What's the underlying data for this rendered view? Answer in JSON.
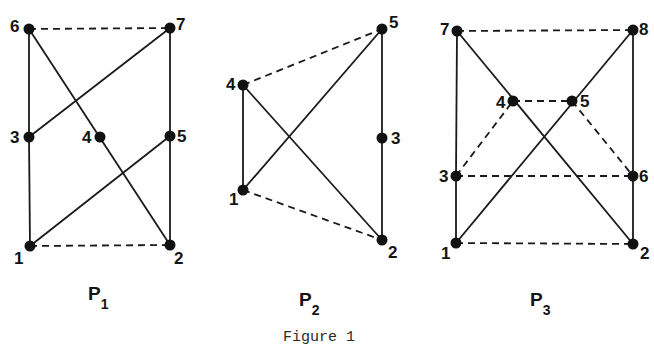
{
  "caption": "Figure 1",
  "colors": {
    "ink": "#111111",
    "background": "#ffffff"
  },
  "panels": [
    {
      "id": "P1",
      "name": "P",
      "subscript": "1",
      "label_pos": [
        88,
        300
      ],
      "nodes": [
        {
          "id": "1",
          "x": 30,
          "y": 246,
          "lx": 14,
          "ly": 264
        },
        {
          "id": "2",
          "x": 170,
          "y": 245,
          "lx": 174,
          "ly": 264
        },
        {
          "id": "3",
          "x": 29,
          "y": 137,
          "lx": 10,
          "ly": 143
        },
        {
          "id": "4",
          "x": 100,
          "y": 137,
          "lx": 82,
          "ly": 143
        },
        {
          "id": "5",
          "x": 170,
          "y": 136,
          "lx": 177,
          "ly": 142
        },
        {
          "id": "6",
          "x": 29,
          "y": 29,
          "lx": 10,
          "ly": 32
        },
        {
          "id": "7",
          "x": 170,
          "y": 28,
          "lx": 176,
          "ly": 30
        }
      ],
      "edges": [
        {
          "from": "6",
          "to": "7",
          "style": "dashed"
        },
        {
          "from": "1",
          "to": "2",
          "style": "dashed"
        },
        {
          "from": "6",
          "to": "3",
          "style": "solid"
        },
        {
          "from": "3",
          "to": "1",
          "style": "solid"
        },
        {
          "from": "7",
          "to": "5",
          "style": "solid"
        },
        {
          "from": "5",
          "to": "2",
          "style": "solid"
        },
        {
          "from": "3",
          "to": "7",
          "style": "solid"
        },
        {
          "from": "6",
          "to": "2",
          "style": "solid"
        },
        {
          "from": "1",
          "to": "5",
          "style": "solid"
        }
      ]
    },
    {
      "id": "P2",
      "name": "P",
      "subscript": "2",
      "label_pos": [
        299,
        306
      ],
      "nodes": [
        {
          "id": "1",
          "x": 243,
          "y": 190,
          "lx": 229,
          "ly": 205
        },
        {
          "id": "2",
          "x": 382,
          "y": 240,
          "lx": 388,
          "ly": 258
        },
        {
          "id": "3",
          "x": 382,
          "y": 138,
          "lx": 391,
          "ly": 144
        },
        {
          "id": "4",
          "x": 243,
          "y": 85,
          "lx": 226,
          "ly": 90
        },
        {
          "id": "5",
          "x": 382,
          "y": 29,
          "lx": 389,
          "ly": 28
        }
      ],
      "edges": [
        {
          "from": "4",
          "to": "5",
          "style": "dashed"
        },
        {
          "from": "1",
          "to": "2",
          "style": "dashed"
        },
        {
          "from": "4",
          "to": "1",
          "style": "solid"
        },
        {
          "from": "5",
          "to": "3",
          "style": "solid"
        },
        {
          "from": "3",
          "to": "2",
          "style": "solid"
        },
        {
          "from": "1",
          "to": "5",
          "style": "solid"
        },
        {
          "from": "4",
          "to": "2",
          "style": "solid"
        }
      ]
    },
    {
      "id": "P3",
      "name": "P",
      "subscript": "3",
      "label_pos": [
        530,
        306
      ],
      "nodes": [
        {
          "id": "1",
          "x": 456,
          "y": 243,
          "lx": 441,
          "ly": 259
        },
        {
          "id": "2",
          "x": 633,
          "y": 244,
          "lx": 640,
          "ly": 259
        },
        {
          "id": "3",
          "x": 456,
          "y": 176,
          "lx": 439,
          "ly": 182
        },
        {
          "id": "4",
          "x": 513,
          "y": 101,
          "lx": 496,
          "ly": 108
        },
        {
          "id": "5",
          "x": 572,
          "y": 101,
          "lx": 580,
          "ly": 107
        },
        {
          "id": "6",
          "x": 633,
          "y": 176,
          "lx": 639,
          "ly": 182
        },
        {
          "id": "7",
          "x": 457,
          "y": 31,
          "lx": 440,
          "ly": 35
        },
        {
          "id": "8",
          "x": 633,
          "y": 30,
          "lx": 639,
          "ly": 35
        }
      ],
      "edges": [
        {
          "from": "7",
          "to": "8",
          "style": "dashed"
        },
        {
          "from": "4",
          "to": "5",
          "style": "dashed"
        },
        {
          "from": "3",
          "to": "4",
          "style": "dashed"
        },
        {
          "from": "5",
          "to": "6",
          "style": "dashed"
        },
        {
          "from": "3",
          "to": "6",
          "style": "dashed"
        },
        {
          "from": "1",
          "to": "2",
          "style": "dashed"
        },
        {
          "from": "7",
          "to": "3",
          "style": "solid"
        },
        {
          "from": "3",
          "to": "1",
          "style": "solid"
        },
        {
          "from": "8",
          "to": "6",
          "style": "solid"
        },
        {
          "from": "6",
          "to": "2",
          "style": "solid"
        },
        {
          "from": "7",
          "to": "2",
          "style": "solid"
        },
        {
          "from": "1",
          "to": "8",
          "style": "solid"
        }
      ]
    }
  ]
}
